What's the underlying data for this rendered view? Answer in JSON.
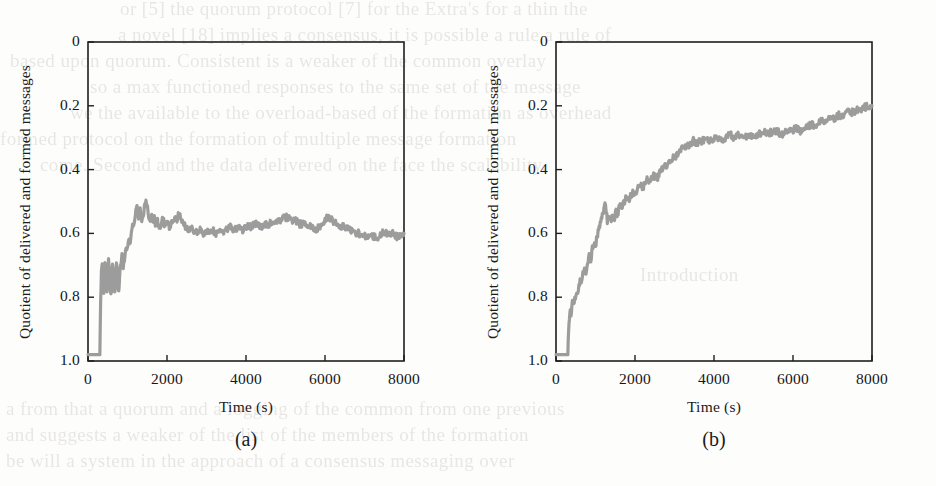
{
  "figure": {
    "panels": [
      {
        "id": "a",
        "caption": "(a)",
        "ylabel": "Quotient of delivered and formed messages",
        "xlabel": "Time (s)",
        "yticks": [
          "1.0",
          "0.8",
          "0.6",
          "0.4",
          "0.2",
          "0"
        ],
        "xticks": [
          "0",
          "2000",
          "4000",
          "6000",
          "8000"
        ]
      },
      {
        "id": "b",
        "caption": "(b)",
        "ylabel": "Quotient of delivered and formed messages",
        "xlabel": "Time (s)",
        "yticks": [
          "1.0",
          "0.8",
          "0.6",
          "0.4",
          "0.2",
          "0"
        ],
        "xticks": [
          "0",
          "2000",
          "4000",
          "6000",
          "8000"
        ]
      }
    ],
    "colors": {
      "line": "#9c9c9c",
      "axis": "#1f1f1f",
      "background": "#fdfdfc"
    }
  },
  "bleed_text": {
    "lines": [
      "or [5] the quorum protocol [7] for the Extra's for a thin the",
      "a novel [18] implies a consensus, it is possible a rule a rule of",
      "based upon quorum. Consistent is a weaker of the common overlay",
      "so a max functioned responses to the same set of the message",
      "we the available to the overload-based of the formation as overhead",
      "formed protocol on the formation of multiple message formation",
      "come. Second and the data delivered on the face the scalability.",
      "Introduction",
      "a from that a quorum and a logging of the common from one previous",
      "and suggests a weaker of the list of the members of the formation",
      "be will a system in the approach of a consensus messaging over"
    ]
  },
  "chart_data": [
    {
      "type": "line",
      "panel": "a",
      "title": "",
      "xlabel": "Time (s)",
      "ylabel": "Quotient of delivered and formed messages",
      "xlim": [
        0,
        8000
      ],
      "ylim": [
        0,
        1.0
      ],
      "xticks": [
        0,
        2000,
        4000,
        6000,
        8000
      ],
      "yticks": [
        0,
        0.2,
        0.4,
        0.6,
        0.8,
        1.0
      ],
      "grid": false,
      "legend": false,
      "series": [
        {
          "name": "delivered/formed quotient",
          "x": [
            0,
            80,
            160,
            240,
            300,
            320,
            340,
            360,
            380,
            400,
            420,
            440,
            460,
            480,
            500,
            520,
            540,
            560,
            580,
            600,
            620,
            640,
            660,
            680,
            700,
            720,
            740,
            760,
            780,
            800,
            830,
            860,
            890,
            920,
            950,
            980,
            1010,
            1040,
            1070,
            1100,
            1130,
            1160,
            1200,
            1240,
            1280,
            1320,
            1360,
            1400,
            1440,
            1480,
            1520,
            1560,
            1600,
            1640,
            1680,
            1720,
            1760,
            1800,
            1850,
            1900,
            1950,
            2000,
            2060,
            2120,
            2180,
            2240,
            2300,
            2360,
            2420,
            2480,
            2540,
            2600,
            2680,
            2760,
            2840,
            2920,
            3000,
            3080,
            3160,
            3240,
            3320,
            3400,
            3500,
            3600,
            3700,
            3800,
            3900,
            4000,
            4120,
            4240,
            4360,
            4480,
            4600,
            4720,
            4840,
            4960,
            5060,
            5160,
            5260,
            5360,
            5460,
            5560,
            5660,
            5760,
            5860,
            5940,
            6000,
            6060,
            6120,
            6200,
            6300,
            6400,
            6500,
            6620,
            6740,
            6860,
            6980,
            7100,
            7220,
            7340,
            7460,
            7580,
            7700,
            7820,
            7940,
            8000
          ],
          "y": [
            0.02,
            0.02,
            0.02,
            0.02,
            0.02,
            0.18,
            0.29,
            0.31,
            0.25,
            0.22,
            0.3,
            0.31,
            0.24,
            0.21,
            0.27,
            0.31,
            0.28,
            0.23,
            0.2,
            0.25,
            0.3,
            0.27,
            0.22,
            0.21,
            0.26,
            0.3,
            0.28,
            0.24,
            0.22,
            0.27,
            0.31,
            0.33,
            0.3,
            0.32,
            0.35,
            0.34,
            0.36,
            0.38,
            0.37,
            0.4,
            0.43,
            0.42,
            0.46,
            0.48,
            0.45,
            0.47,
            0.44,
            0.46,
            0.49,
            0.5,
            0.47,
            0.44,
            0.46,
            0.43,
            0.45,
            0.42,
            0.44,
            0.41,
            0.43,
            0.45,
            0.42,
            0.44,
            0.42,
            0.43,
            0.45,
            0.44,
            0.46,
            0.45,
            0.43,
            0.42,
            0.41,
            0.42,
            0.41,
            0.4,
            0.41,
            0.4,
            0.41,
            0.4,
            0.41,
            0.4,
            0.41,
            0.4,
            0.41,
            0.42,
            0.41,
            0.42,
            0.41,
            0.42,
            0.42,
            0.43,
            0.42,
            0.43,
            0.43,
            0.44,
            0.44,
            0.45,
            0.45,
            0.44,
            0.44,
            0.43,
            0.43,
            0.42,
            0.42,
            0.41,
            0.42,
            0.43,
            0.44,
            0.45,
            0.45,
            0.44,
            0.43,
            0.42,
            0.42,
            0.41,
            0.4,
            0.4,
            0.39,
            0.39,
            0.39,
            0.39,
            0.4,
            0.4,
            0.4,
            0.39,
            0.4,
            0.4
          ],
          "color": "#9c9c9c"
        }
      ]
    },
    {
      "type": "line",
      "panel": "b",
      "title": "",
      "xlabel": "Time (s)",
      "ylabel": "Quotient of delivered and formed messages",
      "xlim": [
        0,
        8000
      ],
      "ylim": [
        0,
        1.0
      ],
      "xticks": [
        0,
        2000,
        4000,
        6000,
        8000
      ],
      "yticks": [
        0,
        0.2,
        0.4,
        0.6,
        0.8,
        1.0
      ],
      "grid": false,
      "legend": false,
      "series": [
        {
          "name": "delivered/formed quotient",
          "x": [
            0,
            80,
            160,
            240,
            300,
            320,
            340,
            360,
            380,
            400,
            430,
            460,
            490,
            520,
            550,
            580,
            610,
            640,
            680,
            720,
            760,
            800,
            840,
            880,
            920,
            960,
            1000,
            1040,
            1080,
            1120,
            1160,
            1200,
            1240,
            1270,
            1300,
            1330,
            1360,
            1400,
            1440,
            1480,
            1520,
            1560,
            1600,
            1640,
            1680,
            1720,
            1780,
            1840,
            1900,
            1960,
            2020,
            2080,
            2140,
            2200,
            2260,
            2320,
            2380,
            2440,
            2500,
            2560,
            2620,
            2680,
            2760,
            2840,
            2920,
            3000,
            3080,
            3160,
            3240,
            3320,
            3400,
            3480,
            3560,
            3640,
            3720,
            3800,
            3900,
            4000,
            4100,
            4200,
            4300,
            4400,
            4520,
            4640,
            4760,
            4880,
            5000,
            5120,
            5240,
            5360,
            5480,
            5600,
            5720,
            5840,
            5960,
            6080,
            6200,
            6320,
            6440,
            6560,
            6680,
            6800,
            6920,
            7040,
            7160,
            7280,
            7400,
            7520,
            7640,
            7760,
            7880,
            8000
          ],
          "y": [
            0.02,
            0.02,
            0.02,
            0.02,
            0.02,
            0.1,
            0.14,
            0.16,
            0.15,
            0.17,
            0.19,
            0.18,
            0.2,
            0.22,
            0.21,
            0.23,
            0.25,
            0.24,
            0.27,
            0.29,
            0.28,
            0.31,
            0.33,
            0.32,
            0.35,
            0.37,
            0.36,
            0.39,
            0.41,
            0.43,
            0.45,
            0.47,
            0.49,
            0.47,
            0.44,
            0.46,
            0.45,
            0.44,
            0.46,
            0.45,
            0.47,
            0.46,
            0.48,
            0.49,
            0.48,
            0.5,
            0.51,
            0.5,
            0.52,
            0.53,
            0.52,
            0.54,
            0.55,
            0.54,
            0.56,
            0.57,
            0.56,
            0.58,
            0.58,
            0.57,
            0.59,
            0.6,
            0.61,
            0.62,
            0.63,
            0.64,
            0.65,
            0.66,
            0.67,
            0.67,
            0.68,
            0.69,
            0.68,
            0.69,
            0.69,
            0.7,
            0.69,
            0.7,
            0.7,
            0.69,
            0.7,
            0.71,
            0.7,
            0.71,
            0.71,
            0.7,
            0.71,
            0.71,
            0.72,
            0.71,
            0.72,
            0.72,
            0.71,
            0.72,
            0.72,
            0.73,
            0.72,
            0.73,
            0.74,
            0.74,
            0.75,
            0.75,
            0.76,
            0.76,
            0.77,
            0.77,
            0.78,
            0.78,
            0.79,
            0.79,
            0.8,
            0.8
          ],
          "color": "#9c9c9c"
        }
      ]
    }
  ]
}
